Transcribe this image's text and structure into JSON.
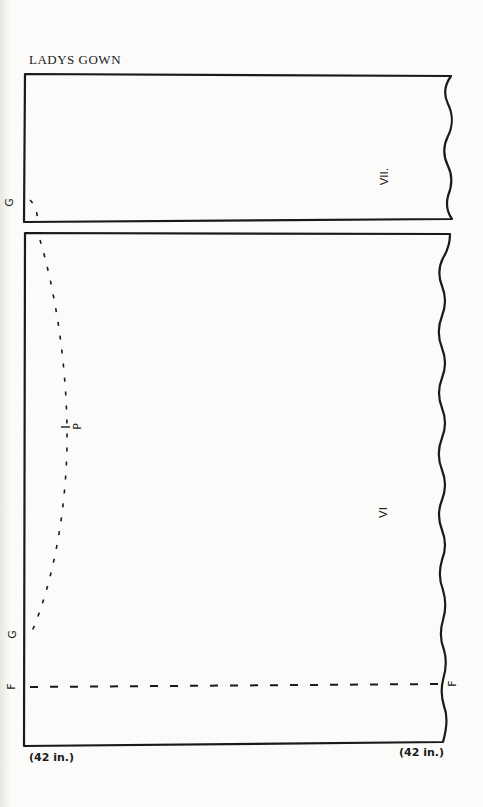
{
  "title": "LADYS GOWN",
  "panels": [
    {
      "id": "VII",
      "label": "VII."
    },
    {
      "id": "VI",
      "label": "VI"
    }
  ],
  "points": {
    "g_top": "G",
    "p_mid": "P",
    "g_bottom": "G",
    "f_left": "F",
    "f_right": "F"
  },
  "measurements": {
    "bottom_left": "(42 in.)",
    "bottom_right": "(42 in.)"
  },
  "colors": {
    "ink": "#1a1a1a",
    "paper": "#fbfbf9"
  }
}
